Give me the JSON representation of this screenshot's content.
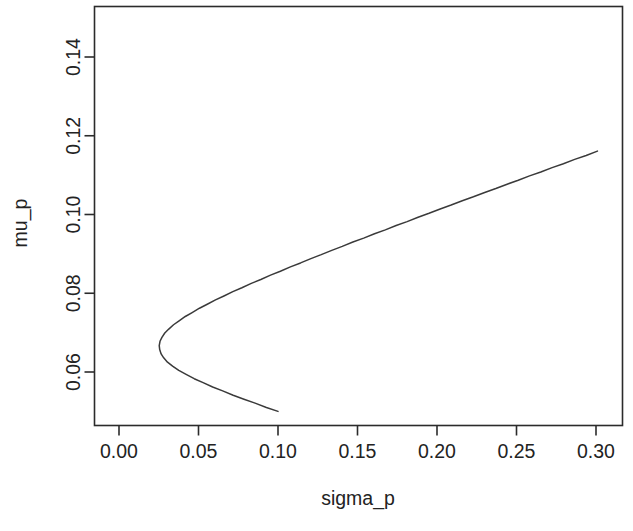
{
  "chart_data": {
    "type": "line",
    "title": "",
    "subtitle": "",
    "xlabel": "sigma_p",
    "ylabel": "mu_p",
    "xlim": [
      -0.0116,
      0.3162
    ],
    "ylim": [
      0.0455,
      0.1535
    ],
    "grid": false,
    "legend": null,
    "xticks": [
      0.0,
      0.05,
      0.1,
      0.15,
      0.2,
      0.25,
      0.3
    ],
    "xticklabels": [
      "0.00",
      "0.05",
      "0.10",
      "0.15",
      "0.20",
      "0.25",
      "0.30"
    ],
    "yticks": [
      0.06,
      0.08,
      0.1,
      0.12,
      0.14
    ],
    "yticklabels": [
      "0.06",
      "0.08",
      "0.10",
      "0.12",
      "0.14"
    ],
    "vertex": {
      "sigma_p": 0.0226,
      "mu_p": 0.0737
    },
    "series": [
      {
        "name": "frontier",
        "x": [
          0.1,
          0.0927,
          0.0856,
          0.0786,
          0.0718,
          0.0652,
          0.0589,
          0.0529,
          0.0473,
          0.0422,
          0.0376,
          0.0337,
          0.0305,
          0.0281,
          0.0265,
          0.0256,
          0.0253,
          0.0258,
          0.027,
          0.0288,
          0.0313,
          0.0343,
          0.0378,
          0.0417,
          0.046,
          0.0506,
          0.0555,
          0.0607,
          0.066,
          0.0716,
          0.0773,
          0.0832,
          0.0892,
          0.0953,
          0.1015,
          0.1078,
          0.1142,
          0.1207,
          0.1272,
          0.1338,
          0.1404,
          0.1471,
          0.1539,
          0.1607,
          0.1675,
          0.1743,
          0.1812,
          0.1881,
          0.195,
          0.202,
          0.2089,
          0.2159,
          0.2229,
          0.23,
          0.237,
          0.2441,
          0.2511,
          0.2582,
          0.2653,
          0.2724,
          0.2795,
          0.2866,
          0.2938,
          0.3009
        ],
        "y": [
          0.05,
          0.051,
          0.0521,
          0.0531,
          0.0541,
          0.0552,
          0.0562,
          0.0573,
          0.0583,
          0.0594,
          0.0604,
          0.0615,
          0.0625,
          0.0636,
          0.0646,
          0.0657,
          0.0667,
          0.0678,
          0.0688,
          0.0699,
          0.0709,
          0.072,
          0.073,
          0.0741,
          0.0751,
          0.0762,
          0.0772,
          0.0783,
          0.0793,
          0.0804,
          0.0814,
          0.0825,
          0.0835,
          0.0846,
          0.0856,
          0.0867,
          0.0877,
          0.0888,
          0.0898,
          0.0909,
          0.0919,
          0.093,
          0.094,
          0.0951,
          0.0961,
          0.0972,
          0.0982,
          0.0993,
          0.1003,
          0.1014,
          0.1024,
          0.1035,
          0.1045,
          0.1056,
          0.1066,
          0.1077,
          0.1087,
          0.1098,
          0.1108,
          0.1119,
          0.1129,
          0.114,
          0.115,
          0.1161
        ]
      }
    ]
  }
}
